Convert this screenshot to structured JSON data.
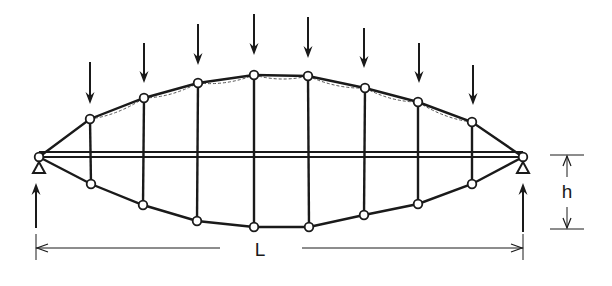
{
  "diagram": {
    "type": "lenticular-truss-with-tie-beam",
    "colors": {
      "line": "#1a1a1a",
      "background": "#ffffff",
      "dashed": "#555555"
    },
    "labels": {
      "span": "L",
      "height": "h"
    },
    "supports": [
      {
        "id": "left",
        "x": 39,
        "y": 157,
        "symbol": "triangle-pin"
      },
      {
        "id": "right",
        "x": 523,
        "y": 157,
        "symbol": "triangle-pin"
      }
    ],
    "beam": {
      "x1": 39,
      "x2": 523,
      "y_top": 152,
      "y_bottom": 157
    },
    "top_chord_nodes": [
      {
        "x": 90,
        "y": 119
      },
      {
        "x": 144,
        "y": 98
      },
      {
        "x": 198,
        "y": 83
      },
      {
        "x": 254,
        "y": 75
      },
      {
        "x": 308,
        "y": 76
      },
      {
        "x": 365,
        "y": 88
      },
      {
        "x": 418,
        "y": 102
      },
      {
        "x": 472,
        "y": 122
      }
    ],
    "bottom_chord_nodes": [
      {
        "x": 91,
        "y": 184
      },
      {
        "x": 143,
        "y": 205
      },
      {
        "x": 197,
        "y": 221
      },
      {
        "x": 254,
        "y": 227
      },
      {
        "x": 309,
        "y": 227
      },
      {
        "x": 364,
        "y": 215
      },
      {
        "x": 418,
        "y": 204
      },
      {
        "x": 472,
        "y": 184
      }
    ],
    "loads": [
      {
        "x": 90,
        "y_start": 62,
        "y_end": 104
      },
      {
        "x": 144,
        "y_start": 43,
        "y_end": 83
      },
      {
        "x": 198,
        "y_start": 24,
        "y_end": 65
      },
      {
        "x": 254,
        "y_start": 14,
        "y_end": 55
      },
      {
        "x": 308,
        "y_start": 17,
        "y_end": 58
      },
      {
        "x": 364,
        "y_start": 28,
        "y_end": 68
      },
      {
        "x": 419,
        "y_start": 43,
        "y_end": 83
      },
      {
        "x": 473,
        "y_start": 65,
        "y_end": 105
      }
    ],
    "reactions": [
      {
        "x": 36,
        "y_start": 228,
        "y_end": 183
      },
      {
        "x": 523,
        "y_start": 232,
        "y_end": 183
      }
    ],
    "span_dimension": {
      "y": 248,
      "x1": 36,
      "x2": 523,
      "label_x": 260,
      "label_y": 256,
      "gap_left": 220,
      "gap_right": 302
    },
    "height_dimension": {
      "x": 567,
      "y_top": 155,
      "y_bottom": 229,
      "label_x": 567,
      "label_y": 198,
      "tick_x1": 550,
      "tick_x2": 584
    }
  }
}
